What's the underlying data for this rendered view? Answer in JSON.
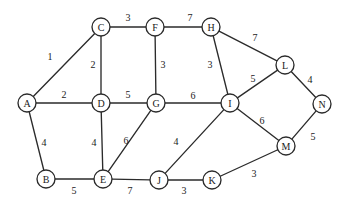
{
  "diagram": {
    "colors": {
      "background": "#ffffff",
      "stroke": "#2b2b2b",
      "node_fill": "#ffffff",
      "text": "#1a1a1a"
    },
    "node_radius": 9
  },
  "chart_data": {
    "type": "graph",
    "title": "",
    "directed": false,
    "weighted": true,
    "node_count": 14,
    "edge_count": 22,
    "nodes": [
      {
        "id": "A",
        "label": "A",
        "x": 27,
        "y": 103
      },
      {
        "id": "B",
        "label": "B",
        "x": 46,
        "y": 179
      },
      {
        "id": "C",
        "label": "C",
        "x": 101,
        "y": 27
      },
      {
        "id": "D",
        "label": "D",
        "x": 101,
        "y": 103
      },
      {
        "id": "E",
        "label": "E",
        "x": 103,
        "y": 179
      },
      {
        "id": "F",
        "label": "F",
        "x": 155,
        "y": 27
      },
      {
        "id": "G",
        "label": "G",
        "x": 156,
        "y": 103
      },
      {
        "id": "H",
        "label": "H",
        "x": 211,
        "y": 27
      },
      {
        "id": "I",
        "label": "I",
        "x": 230,
        "y": 103
      },
      {
        "id": "J",
        "label": "J",
        "x": 159,
        "y": 180
      },
      {
        "id": "K",
        "label": "K",
        "x": 212,
        "y": 180
      },
      {
        "id": "L",
        "label": "L",
        "x": 285,
        "y": 65
      },
      {
        "id": "M",
        "label": "M",
        "x": 286,
        "y": 146
      },
      {
        "id": "N",
        "label": "N",
        "x": 322,
        "y": 104
      }
    ],
    "edges": [
      {
        "source": "A",
        "target": "C",
        "weight": 1,
        "label": "1",
        "lx": 50,
        "ly": 56
      },
      {
        "source": "A",
        "target": "D",
        "weight": 2,
        "label": "2",
        "lx": 64,
        "ly": 94
      },
      {
        "source": "A",
        "target": "B",
        "weight": 4,
        "label": "4",
        "lx": 44,
        "ly": 142
      },
      {
        "source": "C",
        "target": "D",
        "weight": 2,
        "label": "2",
        "lx": 93,
        "ly": 64
      },
      {
        "source": "C",
        "target": "F",
        "weight": 3,
        "label": "3",
        "lx": 128,
        "ly": 17
      },
      {
        "source": "D",
        "target": "G",
        "weight": 5,
        "label": "5",
        "lx": 128,
        "ly": 94
      },
      {
        "source": "D",
        "target": "E",
        "weight": 4,
        "label": "4",
        "lx": 94,
        "ly": 142
      },
      {
        "source": "B",
        "target": "E",
        "weight": 5,
        "label": "5",
        "lx": 74,
        "ly": 190
      },
      {
        "source": "E",
        "target": "G",
        "weight": 6,
        "label": "6",
        "lx": 126,
        "ly": 140
      },
      {
        "source": "E",
        "target": "J",
        "weight": 7,
        "label": "7",
        "lx": 130,
        "ly": 190
      },
      {
        "source": "F",
        "target": "G",
        "weight": 3,
        "label": "3",
        "lx": 163,
        "ly": 64
      },
      {
        "source": "F",
        "target": "H",
        "weight": 7,
        "label": "7",
        "lx": 190,
        "ly": 17
      },
      {
        "source": "G",
        "target": "I",
        "weight": 6,
        "label": "6",
        "lx": 193,
        "ly": 95
      },
      {
        "source": "H",
        "target": "I",
        "weight": 3,
        "label": "3",
        "lx": 210,
        "ly": 64
      },
      {
        "source": "H",
        "target": "L",
        "weight": 7,
        "label": "7",
        "lx": 255,
        "ly": 37
      },
      {
        "source": "I",
        "target": "L",
        "weight": 5,
        "label": "5",
        "lx": 253,
        "ly": 78
      },
      {
        "source": "I",
        "target": "J",
        "weight": 4,
        "label": "4",
        "lx": 176,
        "ly": 141
      },
      {
        "source": "I",
        "target": "M",
        "weight": 6,
        "label": "6",
        "lx": 262,
        "ly": 120
      },
      {
        "source": "J",
        "target": "K",
        "weight": 3,
        "label": "3",
        "lx": 184,
        "ly": 190
      },
      {
        "source": "K",
        "target": "M",
        "weight": 3,
        "label": "3",
        "lx": 254,
        "ly": 173
      },
      {
        "source": "L",
        "target": "N",
        "weight": 4,
        "label": "4",
        "lx": 310,
        "ly": 79
      },
      {
        "source": "M",
        "target": "N",
        "weight": 5,
        "label": "5",
        "lx": 313,
        "ly": 136
      }
    ]
  }
}
